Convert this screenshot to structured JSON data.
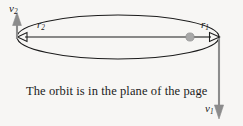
{
  "figure": {
    "caption": "The orbit is in the plane of the page",
    "background_color": "#f7f6f4",
    "stroke_color": "#1b1b1b",
    "vector_color": "#8c8c8c",
    "body_color": "#a8a8a8"
  },
  "labels": {
    "r1": {
      "base": "r",
      "sub": "1"
    },
    "r2": {
      "base": "r",
      "sub": "2"
    },
    "v1": {
      "base": "v",
      "sub": "1"
    },
    "v2": {
      "base": "v",
      "sub": "2"
    }
  },
  "geometry": {
    "ellipse": {
      "cx": 118,
      "cy": 37,
      "rx": 101,
      "ry": 22
    },
    "focus_body": {
      "cx": 190,
      "cy": 37,
      "r": 4
    },
    "radius_vector_r1": {
      "x1": 190,
      "y1": 37,
      "x2": 219,
      "y2": 37,
      "direction": "right"
    },
    "radius_vector_r2": {
      "x1": 190,
      "y1": 37,
      "x2": 17,
      "y2": 37,
      "direction": "left"
    },
    "velocity_vector_v1": {
      "x1": 219,
      "y1": 38,
      "x2": 219,
      "y2": 118,
      "direction": "down"
    },
    "velocity_vector_v2": {
      "x1": 17,
      "y1": 38,
      "x2": 17,
      "y2": 13,
      "direction": "up"
    }
  }
}
